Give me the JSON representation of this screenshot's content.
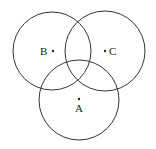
{
  "diagram": {
    "type": "venn",
    "circles": [
      {
        "id": "B",
        "label": "B",
        "cx": 52,
        "cy": 51,
        "r": 39
      },
      {
        "id": "C",
        "label": "C",
        "cx": 105,
        "cy": 51,
        "r": 40
      },
      {
        "id": "A",
        "label": "A",
        "cx": 79,
        "cy": 100,
        "r": 40
      }
    ],
    "points": [
      {
        "label": "B",
        "x": 53,
        "y": 51
      },
      {
        "label": "C",
        "x": 105,
        "y": 51
      },
      {
        "label": "A",
        "x": 79,
        "y": 99
      }
    ],
    "stroke_color": "#333333"
  }
}
